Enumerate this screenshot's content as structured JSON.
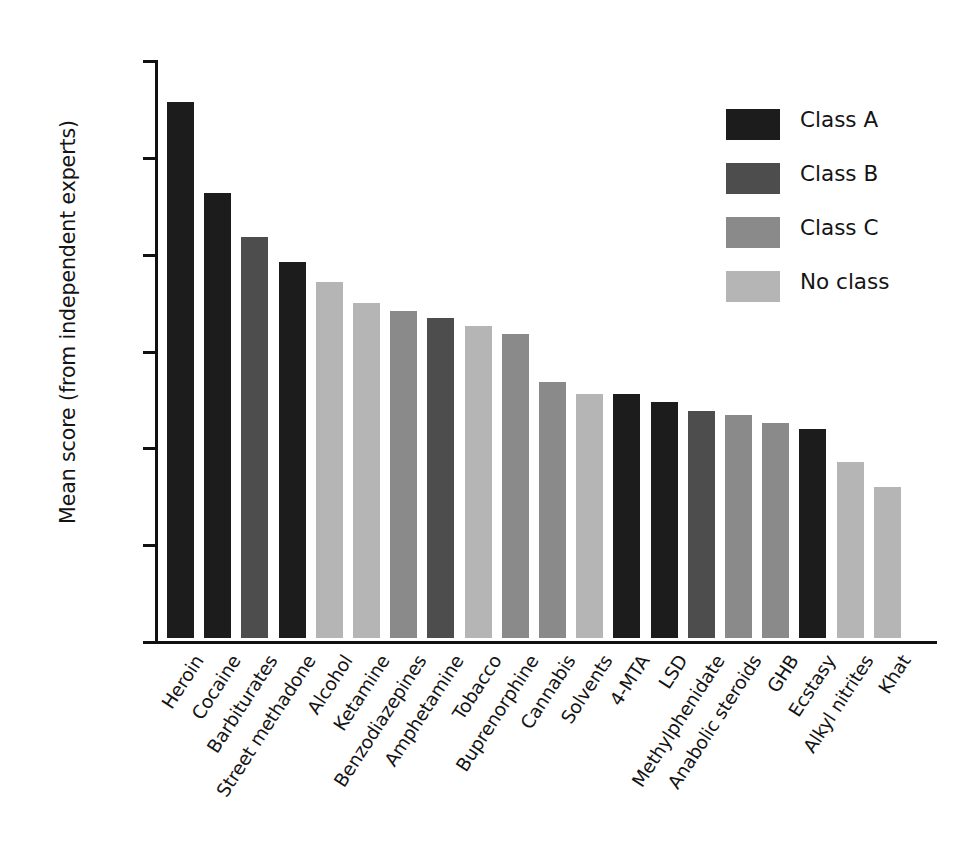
{
  "chart_data": {
    "type": "bar",
    "title": "",
    "xlabel": "",
    "ylabel": "Mean score (from independent experts)",
    "ylim": [
      0.0,
      3.0
    ],
    "ytick_labels": [
      "3.0",
      "2.5",
      "2.0",
      "1.5",
      "1.0",
      "0.5",
      "0.0"
    ],
    "ytick_values": [
      3.0,
      2.5,
      2.0,
      1.5,
      1.0,
      0.5,
      0.0
    ],
    "grid": false,
    "legend_position": "top-right",
    "categories": [
      "Heroin",
      "Cocaine",
      "Barbiturates",
      "Street methadone",
      "Alcohol",
      "Ketamine",
      "Benzodiazepines",
      "Amphetamine",
      "Tobacco",
      "Buprenorphine",
      "Cannabis",
      "Solvents",
      "4-MTA",
      "LSD",
      "Methylphenidate",
      "Anabolic steroids",
      "GHB",
      "Ecstasy",
      "Alkyl nitrites",
      "Khat"
    ],
    "values": [
      2.77,
      2.3,
      2.07,
      1.94,
      1.84,
      1.73,
      1.69,
      1.65,
      1.61,
      1.57,
      1.32,
      1.26,
      1.26,
      1.22,
      1.17,
      1.15,
      1.11,
      1.08,
      0.91,
      0.78
    ],
    "bar_classes": [
      "Class A",
      "Class A",
      "Class B",
      "Class A",
      "No class",
      "No class",
      "Class C",
      "Class B",
      "No class",
      "Class C",
      "Class C",
      "No class",
      "Class A",
      "Class A",
      "Class B",
      "Class C",
      "Class C",
      "Class A",
      "No class",
      "No class"
    ],
    "legend": [
      {
        "label": "Class A",
        "color": "#1c1c1c"
      },
      {
        "label": "Class B",
        "color": "#4d4d4d"
      },
      {
        "label": "Class C",
        "color": "#8a8a8a"
      },
      {
        "label": "No class",
        "color": "#b5b5b5"
      }
    ],
    "class_colors": {
      "Class A": "#1c1c1c",
      "Class B": "#4d4d4d",
      "Class C": "#8a8a8a",
      "No class": "#b5b5b5"
    }
  }
}
